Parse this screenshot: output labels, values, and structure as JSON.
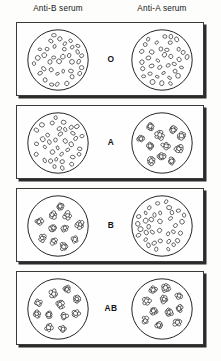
{
  "figure": {
    "background_color": "#fdfdfc",
    "ink_color": "#1a1a1a"
  },
  "headers": {
    "left": "Anti-B serum",
    "right": "Anti-A serum"
  },
  "legend": {
    "dispersed_meaning": "no agglutination",
    "clumped_meaning": "agglutination"
  },
  "rows": [
    {
      "blood_type": "O",
      "left_well": {
        "serum": "Anti-B serum",
        "pattern": "dispersed",
        "agglutination": "negative",
        "cell_count": 36,
        "clump_count": 0
      },
      "right_well": {
        "serum": "Anti-A serum",
        "pattern": "dispersed",
        "agglutination": "negative",
        "cell_count": 36,
        "clump_count": 0
      }
    },
    {
      "blood_type": "A",
      "left_well": {
        "serum": "Anti-B serum",
        "pattern": "dispersed",
        "agglutination": "negative",
        "cell_count": 36,
        "clump_count": 0
      },
      "right_well": {
        "serum": "Anti-A serum",
        "pattern": "clumped",
        "agglutination": "positive",
        "cell_count": 0,
        "clump_count": 11
      }
    },
    {
      "blood_type": "B",
      "left_well": {
        "serum": "Anti-B serum",
        "pattern": "clumped",
        "agglutination": "positive",
        "cell_count": 0,
        "clump_count": 11
      },
      "right_well": {
        "serum": "Anti-A serum",
        "pattern": "dispersed",
        "agglutination": "negative",
        "cell_count": 36,
        "clump_count": 0
      }
    },
    {
      "blood_type": "AB",
      "left_well": {
        "serum": "Anti-B serum",
        "pattern": "clumped",
        "agglutination": "positive",
        "cell_count": 0,
        "clump_count": 11
      },
      "right_well": {
        "serum": "Anti-A serum",
        "pattern": "clumped",
        "agglutination": "positive",
        "cell_count": 0,
        "clump_count": 11
      }
    }
  ]
}
